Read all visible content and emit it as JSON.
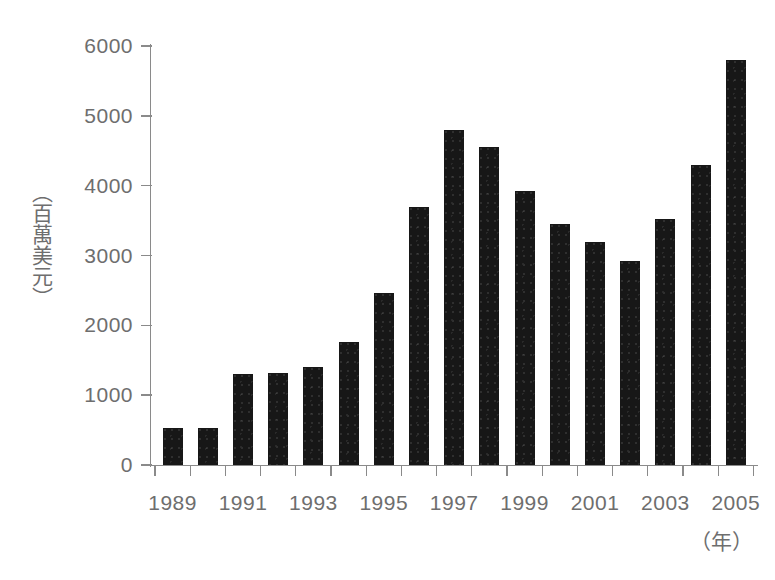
{
  "chart_data": {
    "type": "bar",
    "title": "",
    "subtitle": "",
    "xlabel": "（年）",
    "ylabel": "（百萬美元）",
    "categories": [
      "1989",
      "1990",
      "1991",
      "1992",
      "1993",
      "1994",
      "1995",
      "1996",
      "1997",
      "1998",
      "1999",
      "2000",
      "2001",
      "2002",
      "2003",
      "2004",
      "2005"
    ],
    "values": [
      530,
      530,
      1300,
      1320,
      1400,
      1760,
      2470,
      3700,
      4800,
      4560,
      3930,
      3450,
      3200,
      2920,
      3520,
      4300,
      5800
    ],
    "x_tick_labels": [
      "1989",
      "1991",
      "1993",
      "1995",
      "1997",
      "1999",
      "2001",
      "2003",
      "2005"
    ],
    "y_tick_labels": [
      "0",
      "1000",
      "2000",
      "3000",
      "4000",
      "5000",
      "6000"
    ],
    "y_ticks": [
      0,
      1000,
      2000,
      3000,
      4000,
      5000,
      6000
    ],
    "ylim": [
      0,
      6000
    ],
    "grid": false,
    "legend": null,
    "bar_color": "#171717",
    "axis_color": "#8a8a8a",
    "text_color": "#6e6e6e",
    "background": "#ffffff"
  }
}
